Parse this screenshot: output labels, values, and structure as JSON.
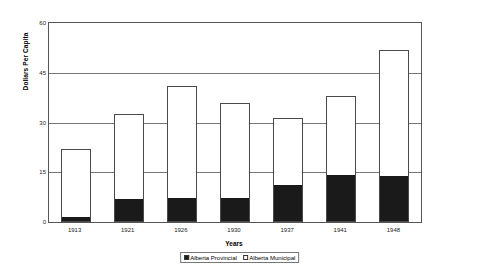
{
  "chart_data": {
    "type": "bar",
    "subtype": "stacked-vertical",
    "title": "",
    "xlabel": "Years",
    "ylabel": "Dollars Per Capita",
    "categories": [
      "1913",
      "1921",
      "1926",
      "1930",
      "1937",
      "1941",
      "1948"
    ],
    "series": [
      {
        "name": "Alberta Provincial",
        "color": "#1a1a1a",
        "values": [
          1.2,
          6.5,
          7.0,
          7.0,
          11.0,
          14.0,
          13.5
        ]
      },
      {
        "name": "Alberta Municipal",
        "color": "#ffffff",
        "values": [
          20.8,
          26.0,
          34.0,
          29.0,
          20.5,
          24.0,
          38.5
        ]
      }
    ],
    "totals": [
      22.0,
      32.5,
      41.0,
      36.0,
      31.5,
      38.0,
      52.0
    ],
    "ylim": [
      0,
      60
    ],
    "yticks": [
      0,
      15,
      30,
      45,
      60
    ],
    "ytick_labels": [
      "0",
      "15",
      "30",
      "45",
      "60"
    ],
    "grid": true,
    "grid_axis": "y",
    "legend_position": "bottom-center",
    "legend_entries": [
      "Alberta Provincial",
      "Alberta Municipal"
    ]
  },
  "axes": {
    "y_title": "Dollars Per Capita",
    "x_title": "Years"
  },
  "legend": {
    "items": [
      {
        "label": "Alberta Provincial",
        "style": "filled"
      },
      {
        "label": "Alberta Municipal",
        "style": "hollow"
      }
    ]
  },
  "colors": {
    "provincial": "#1a1a1a",
    "municipal": "#ffffff",
    "bar_outline": "#4a4a4a",
    "gridline": "#777777",
    "frame": "#555555"
  }
}
